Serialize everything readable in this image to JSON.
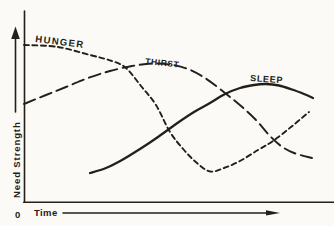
{
  "figure": {
    "background": "#fbfaf6",
    "ink": "#242019"
  },
  "chart_data": {
    "type": "line",
    "title": "",
    "xlabel": "Time",
    "ylabel": "Need Strength",
    "origin_label": "0",
    "grid": false,
    "axes_numeric": false,
    "legend_position": "inline-labels-above-curves",
    "xlim": [
      0,
      10
    ],
    "ylim": [
      0,
      10
    ],
    "series": [
      {
        "name": "HUNGER",
        "line_style": "short-dash",
        "dash": "5,3.5",
        "stroke_width": 1.9,
        "label": {
          "x": 35,
          "y": 42,
          "angle": 7,
          "size": 9.5,
          "spacing": 1.4
        },
        "points_px": [
          [
            24,
            45
          ],
          [
            58,
            47
          ],
          [
            90,
            55
          ],
          [
            112,
            61
          ],
          [
            126,
            68
          ],
          [
            141,
            86
          ],
          [
            156,
            105
          ],
          [
            170,
            132
          ],
          [
            184,
            150
          ],
          [
            197,
            163
          ],
          [
            210,
            171.5
          ],
          [
            224,
            168
          ],
          [
            240,
            161
          ],
          [
            258,
            150
          ],
          [
            273,
            141
          ],
          [
            291,
            127
          ],
          [
            309,
            112
          ]
        ],
        "values": [
          [
            0,
            9.1
          ],
          [
            1.2,
            9.0
          ],
          [
            2.3,
            8.5
          ],
          [
            3.1,
            8.2
          ],
          [
            3.5,
            7.8
          ],
          [
            4.1,
            6.7
          ],
          [
            4.6,
            5.6
          ],
          [
            5.1,
            4.1
          ],
          [
            5.6,
            3.0
          ],
          [
            6.0,
            2.3
          ],
          [
            6.5,
            1.8
          ],
          [
            6.9,
            2.0
          ],
          [
            7.5,
            2.4
          ],
          [
            8.1,
            3.0
          ],
          [
            8.6,
            3.5
          ],
          [
            9.3,
            4.4
          ],
          [
            9.9,
            5.2
          ]
        ]
      },
      {
        "name": "THIRST",
        "line_style": "long-dash",
        "dash": "12,5.5",
        "stroke_width": 1.9,
        "label": {
          "x": 145,
          "y": 64,
          "angle": 6,
          "size": 8.5,
          "spacing": 0.6
        },
        "points_px": [
          [
            24,
            104
          ],
          [
            46,
            95
          ],
          [
            66,
            87
          ],
          [
            88,
            78
          ],
          [
            110,
            71
          ],
          [
            132,
            66
          ],
          [
            152,
            63.5
          ],
          [
            170,
            64.5
          ],
          [
            188,
            69
          ],
          [
            205,
            78
          ],
          [
            225,
            93
          ],
          [
            241,
            106
          ],
          [
            256,
            120
          ],
          [
            269,
            135
          ],
          [
            281,
            146
          ],
          [
            294,
            153
          ],
          [
            312,
            158
          ]
        ],
        "values": [
          [
            0,
            5.7
          ],
          [
            0.8,
            6.2
          ],
          [
            1.5,
            6.7
          ],
          [
            2.2,
            7.2
          ],
          [
            3.0,
            7.6
          ],
          [
            3.8,
            7.9
          ],
          [
            4.4,
            8.1
          ],
          [
            5.1,
            8.0
          ],
          [
            5.7,
            7.7
          ],
          [
            6.3,
            7.2
          ],
          [
            7.0,
            6.3
          ],
          [
            7.5,
            5.6
          ],
          [
            8.1,
            4.8
          ],
          [
            8.5,
            3.9
          ],
          [
            8.9,
            3.3
          ],
          [
            9.4,
            2.8
          ],
          [
            10,
            2.6
          ]
        ]
      },
      {
        "name": "SLEEP",
        "line_style": "solid",
        "dash": "",
        "stroke_width": 2.3,
        "label": {
          "x": 250,
          "y": 81,
          "angle": 4,
          "size": 9,
          "spacing": 0.7
        },
        "points_px": [
          [
            90,
            173
          ],
          [
            106,
            168
          ],
          [
            122,
            160
          ],
          [
            140,
            149
          ],
          [
            158,
            137
          ],
          [
            176,
            124
          ],
          [
            194,
            112
          ],
          [
            210,
            103
          ],
          [
            225,
            94
          ],
          [
            240,
            88
          ],
          [
            254,
            85
          ],
          [
            266,
            84
          ],
          [
            279,
            85.5
          ],
          [
            292,
            89.5
          ],
          [
            304,
            94
          ],
          [
            313,
            98
          ]
        ],
        "values": [
          [
            2.3,
            1.7
          ],
          [
            2.8,
            2.0
          ],
          [
            3.4,
            2.4
          ],
          [
            4.0,
            3.1
          ],
          [
            4.7,
            3.8
          ],
          [
            5.3,
            4.5
          ],
          [
            5.9,
            5.2
          ],
          [
            6.5,
            5.8
          ],
          [
            7.0,
            6.3
          ],
          [
            7.5,
            6.6
          ],
          [
            8.0,
            6.8
          ],
          [
            8.4,
            6.9
          ],
          [
            8.9,
            6.8
          ],
          [
            9.3,
            6.5
          ],
          [
            9.7,
            6.3
          ],
          [
            10,
            6.0
          ]
        ]
      }
    ]
  }
}
